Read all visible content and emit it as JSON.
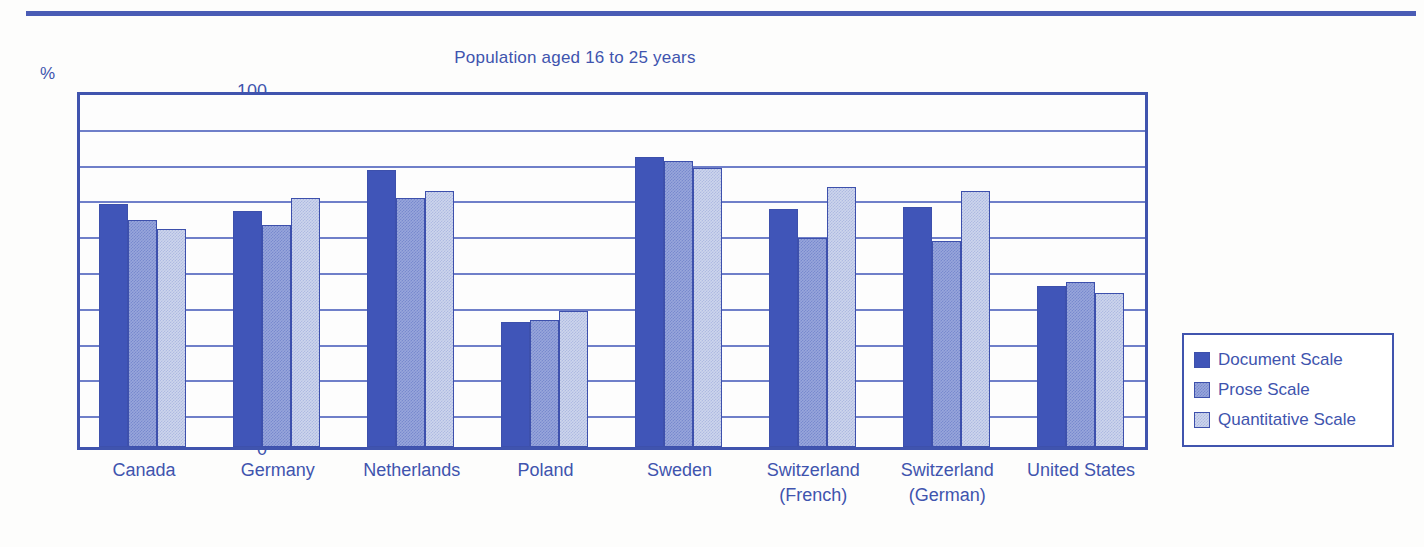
{
  "chart_data": {
    "type": "bar",
    "title": "Population aged 16 to 25 years",
    "xlabel": "",
    "ylabel": "%",
    "ylim": [
      0,
      100
    ],
    "ytick_step": 10,
    "grid": true,
    "legend_position": "right",
    "ytick_labels": [
      "100",
      "90",
      "80",
      "70",
      "60",
      "50",
      "40",
      "30",
      "20",
      "10",
      "0"
    ],
    "categories": [
      "Canada",
      "Germany",
      "Netherlands",
      "Poland",
      "Sweden",
      "Switzerland\n(French)",
      "Switzerland\n(German)",
      "United States"
    ],
    "category_lines": [
      [
        "Canada"
      ],
      [
        "Germany"
      ],
      [
        "Netherlands"
      ],
      [
        "Poland"
      ],
      [
        "Sweden"
      ],
      [
        "Switzerland",
        "(French)"
      ],
      [
        "Switzerland",
        "(German)"
      ],
      [
        "United States"
      ]
    ],
    "series": [
      {
        "name": "Document Scale",
        "color": "#4055b8",
        "values": [
          68.0,
          66.0,
          77.5,
          35.0,
          81.0,
          66.5,
          67.0,
          45.0
        ]
      },
      {
        "name": "Prose Scale",
        "color": "#98a6db",
        "values": [
          63.5,
          62.0,
          69.5,
          35.5,
          80.0,
          58.5,
          57.5,
          46.0
        ]
      },
      {
        "name": "Quantitative Scale",
        "color": "#cdd5ec",
        "values": [
          61.0,
          69.5,
          71.5,
          38.0,
          78.0,
          72.5,
          71.5,
          43.0
        ]
      }
    ]
  },
  "style": {
    "accent": "#4054ae",
    "grid_color": "#6f7fc9",
    "frame_color": "#4054ae",
    "background": "#fdfdfc"
  }
}
